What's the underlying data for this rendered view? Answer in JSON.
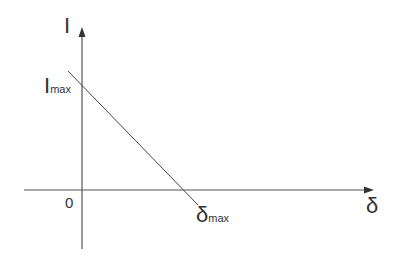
{
  "diagram": {
    "type": "linear decreasing relationship on I–δ axes",
    "y_axis_label": "I",
    "x_axis_label": "δ",
    "origin_label": "0",
    "y_intercept_label": {
      "main": "I",
      "sub": "max"
    },
    "x_intercept_label": {
      "main": "δ",
      "sub": "max"
    },
    "line": {
      "from": "I_max on I-axis",
      "to": "δ_max on δ-axis"
    },
    "colors": {
      "axis": "#555555",
      "line": "#444444",
      "text": "#333333"
    }
  }
}
